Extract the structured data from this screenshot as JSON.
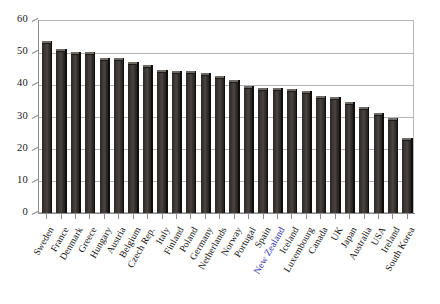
{
  "chart_data": {
    "type": "bar",
    "title": "",
    "subtitle": "",
    "xlabel": "",
    "ylabel": "",
    "ylim": [
      0,
      60
    ],
    "yticks": [
      0,
      10,
      20,
      30,
      40,
      50,
      60
    ],
    "grid": true,
    "legend": false,
    "legend_position": "none",
    "highlight_category": "New Zealand",
    "highlight_color": "#2b2ba8",
    "bar_color": "#3c3835",
    "categories": [
      "Sweden",
      "France",
      "Denmark",
      "Greece",
      "Hungary",
      "Austria",
      "Belgium",
      "Czech Rep.",
      "Italy",
      "Finland",
      "Poland",
      "Germany",
      "Netherlands",
      "Norway",
      "Portugal",
      "Spain",
      "New Zealand",
      "Iceland",
      "Luxembourg",
      "Canada",
      "UK",
      "Japan",
      "Australia",
      "USA",
      "Ireland",
      "South Korea"
    ],
    "values": [
      53.5,
      51.0,
      50.0,
      50.0,
      48.2,
      48.2,
      46.8,
      46.0,
      44.5,
      44.0,
      44.0,
      43.5,
      42.6,
      41.5,
      39.5,
      39.0,
      38.8,
      38.5,
      37.8,
      36.5,
      36.0,
      34.5,
      33.0,
      31.0,
      29.5,
      23.2
    ]
  }
}
